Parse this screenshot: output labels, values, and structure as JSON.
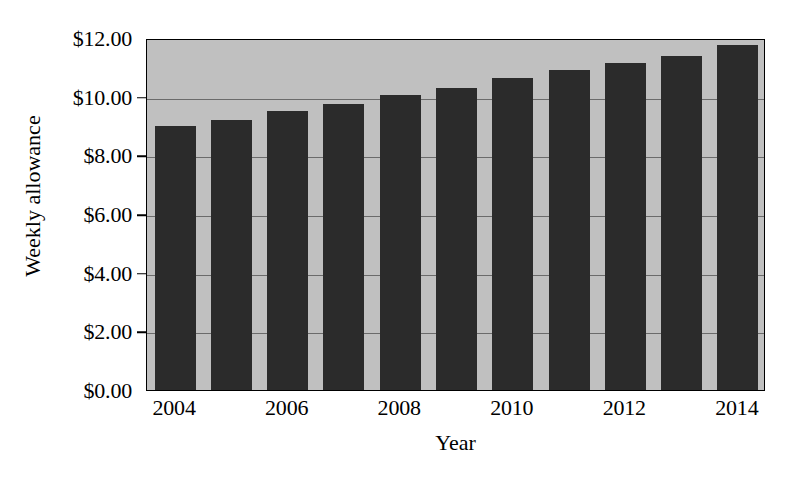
{
  "chart_data": {
    "type": "bar",
    "title": "",
    "xlabel": "Year",
    "ylabel": "Weekly allowance",
    "categories": [
      "2004",
      "2005",
      "2006",
      "2007",
      "2008",
      "2009",
      "2010",
      "2011",
      "2012",
      "2013",
      "2014"
    ],
    "values": [
      9.0,
      9.2,
      9.5,
      9.75,
      10.05,
      10.3,
      10.65,
      10.9,
      11.15,
      11.4,
      11.75
    ],
    "ylim": [
      0,
      12
    ],
    "ytick_values": [
      0,
      2,
      4,
      6,
      8,
      10,
      12
    ],
    "ytick_labels": [
      "$0.00",
      "$2.00",
      "$4.00",
      "$6.00",
      "$8.00",
      "$10.00",
      "$12.00"
    ],
    "xtick_labels": [
      "2004",
      "2006",
      "2008",
      "2010",
      "2012",
      "2014"
    ],
    "xtick_category_indices": [
      0,
      2,
      4,
      6,
      8,
      10
    ],
    "grid": true,
    "grid_axis": "y",
    "legend": "none",
    "series_name": "Weekly allowance",
    "colors": {
      "bar": "#2b2b2b",
      "plot_background": "#c0c0c0",
      "gridline": "#6b6b6b",
      "axis": "#000000",
      "page_background": "#ffffff",
      "text": "#000000"
    }
  }
}
